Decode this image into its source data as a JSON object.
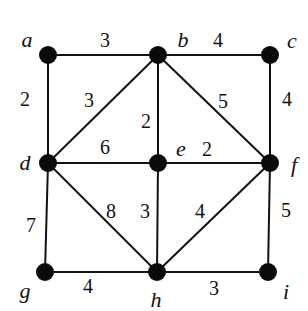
{
  "graph": {
    "nodes": [
      {
        "id": "a",
        "label": "a",
        "x": 48,
        "y": 55,
        "lx": 27,
        "ly": 40
      },
      {
        "id": "b",
        "label": "b",
        "x": 158,
        "y": 55,
        "lx": 183,
        "ly": 40
      },
      {
        "id": "c",
        "label": "c",
        "x": 270,
        "y": 55,
        "lx": 292,
        "ly": 41
      },
      {
        "id": "d",
        "label": "d",
        "x": 48,
        "y": 163,
        "lx": 25,
        "ly": 163
      },
      {
        "id": "e",
        "label": "e",
        "x": 158,
        "y": 163,
        "lx": 181,
        "ly": 149
      },
      {
        "id": "f",
        "label": "f",
        "x": 270,
        "y": 163,
        "lx": 294,
        "ly": 165
      },
      {
        "id": "g",
        "label": "g",
        "x": 45,
        "y": 272,
        "lx": 25,
        "ly": 291
      },
      {
        "id": "h",
        "label": "h",
        "x": 157,
        "y": 272,
        "lx": 156,
        "ly": 300
      },
      {
        "id": "i",
        "label": "i",
        "x": 268,
        "y": 272,
        "lx": 286,
        "ly": 292
      }
    ],
    "edges": [
      {
        "from": "a",
        "to": "b",
        "weight": "3",
        "lx": 105,
        "ly": 40
      },
      {
        "from": "b",
        "to": "c",
        "weight": "4",
        "lx": 218,
        "ly": 40
      },
      {
        "from": "a",
        "to": "d",
        "weight": "2",
        "lx": 25,
        "ly": 99
      },
      {
        "from": "b",
        "to": "d",
        "weight": "3",
        "lx": 89,
        "ly": 100
      },
      {
        "from": "b",
        "to": "e",
        "weight": "2",
        "lx": 146,
        "ly": 121
      },
      {
        "from": "b",
        "to": "f",
        "weight": "5",
        "lx": 223,
        "ly": 101
      },
      {
        "from": "c",
        "to": "f",
        "weight": "4",
        "lx": 287,
        "ly": 99
      },
      {
        "from": "d",
        "to": "e",
        "weight": "6",
        "lx": 105,
        "ly": 147
      },
      {
        "from": "e",
        "to": "f",
        "weight": "2",
        "lx": 207,
        "ly": 149
      },
      {
        "from": "d",
        "to": "g",
        "weight": "7",
        "lx": 31,
        "ly": 225
      },
      {
        "from": "d",
        "to": "h",
        "weight": "8",
        "lx": 111,
        "ly": 211
      },
      {
        "from": "e",
        "to": "h",
        "weight": "3",
        "lx": 145,
        "ly": 211
      },
      {
        "from": "f",
        "to": "h",
        "weight": "4",
        "lx": 200,
        "ly": 211
      },
      {
        "from": "f",
        "to": "i",
        "weight": "5",
        "lx": 286,
        "ly": 210
      },
      {
        "from": "g",
        "to": "h",
        "weight": "4",
        "lx": 88,
        "ly": 286
      },
      {
        "from": "h",
        "to": "i",
        "weight": "3",
        "lx": 214,
        "ly": 288
      }
    ],
    "colors": {
      "stroke": "#111111",
      "node": "#0a0a0a",
      "background": "#ffffff"
    }
  }
}
